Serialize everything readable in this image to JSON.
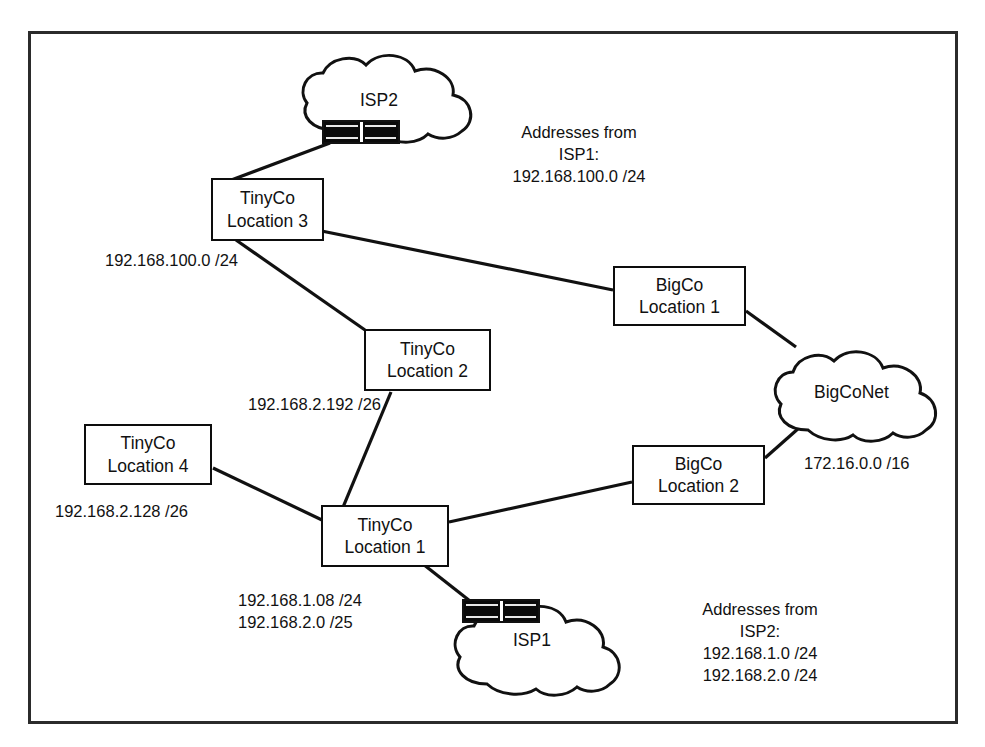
{
  "diagram": {
    "border_color": "#2b2b2b",
    "line_color": "#111111",
    "nodes": [
      {
        "id": "tinyco3",
        "line1": "TinyCo",
        "line2": "Location 3"
      },
      {
        "id": "bigco1",
        "line1": "BigCo",
        "line2": "Location 1"
      },
      {
        "id": "tinyco2",
        "line1": "TinyCo",
        "line2": "Location 2"
      },
      {
        "id": "tinyco4",
        "line1": "TinyCo",
        "line2": "Location 4"
      },
      {
        "id": "bigco2",
        "line1": "BigCo",
        "line2": "Location 2"
      },
      {
        "id": "tinyco1",
        "line1": "TinyCo",
        "line2": "Location 1"
      }
    ],
    "clouds": [
      {
        "id": "isp2",
        "label": "ISP2"
      },
      {
        "id": "bigconet",
        "label": "BigCoNet"
      },
      {
        "id": "isp1",
        "label": "ISP1"
      }
    ],
    "routers": [
      {
        "id": "isp2-router",
        "name": "router-isp2"
      },
      {
        "id": "isp1-router",
        "name": "router-isp1"
      }
    ],
    "annotations": {
      "isp1_block": {
        "line1": "Addresses from",
        "line2": "ISP1:",
        "line3": "192.168.100.0 /24"
      },
      "isp2_block": {
        "line1": "Addresses from",
        "line2": "ISP2:",
        "line3": "192.168.1.0 /24",
        "line4": "192.168.2.0 /24"
      },
      "tinyco3_subnet": "192.168.100.0 /24",
      "tinyco2_subnet": "192.168.2.192 /26",
      "tinyco4_subnet": "192.168.2.128 /26",
      "tinyco1_subnet_1": "192.168.1.08 /24",
      "tinyco1_subnet_2": "192.168.2.0 /25",
      "bigconet_subnet": "172.16.0.0 /16"
    },
    "footnote": ""
  }
}
